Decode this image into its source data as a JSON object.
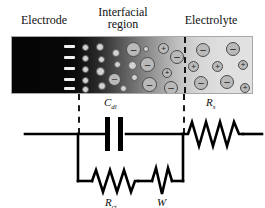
{
  "figure": {
    "title_regions": {
      "electrode": "Electrode",
      "interfacial_line1": "Interfacial",
      "interfacial_line2": "region",
      "electrolyte": "Electrolyte"
    },
    "panel": {
      "description": "electrode-electrolyte interface gradient panel",
      "electrode_surface_charges": [
        "–",
        "–",
        "–",
        "–",
        "–"
      ],
      "ion_symbols": {
        "negative": "–",
        "positive": "+"
      },
      "boundary_marker": "dashed-line"
    }
  },
  "circuit": {
    "name": "Randles equivalent circuit",
    "elements": [
      {
        "id": "cdl",
        "symbol": "C",
        "subscript": "dl",
        "type": "capacitor",
        "meaning": "double layer capacitance"
      },
      {
        "id": "rct",
        "symbol": "R",
        "subscript": "ct",
        "type": "resistor",
        "meaning": "charge transfer resistance"
      },
      {
        "id": "w",
        "symbol": "W",
        "subscript": "",
        "type": "warburg",
        "meaning": "Warburg diffusion element"
      },
      {
        "id": "rs",
        "symbol": "R",
        "subscript": "s",
        "type": "resistor",
        "meaning": "solution resistance"
      }
    ],
    "labels": {
      "cdl_main": "C",
      "cdl_sub": "dl",
      "rct_main": "R",
      "rct_sub": "ct",
      "w_main": "W",
      "rs_main": "R",
      "rs_sub": "s"
    }
  },
  "colors": {
    "ink": "#111111",
    "wire": "#000000",
    "panel_border": "#a8a8a8",
    "ion_fill": "#b9b9b9",
    "ion_stroke": "#4a4a4a",
    "charge_bar": "#f2f2f2"
  }
}
